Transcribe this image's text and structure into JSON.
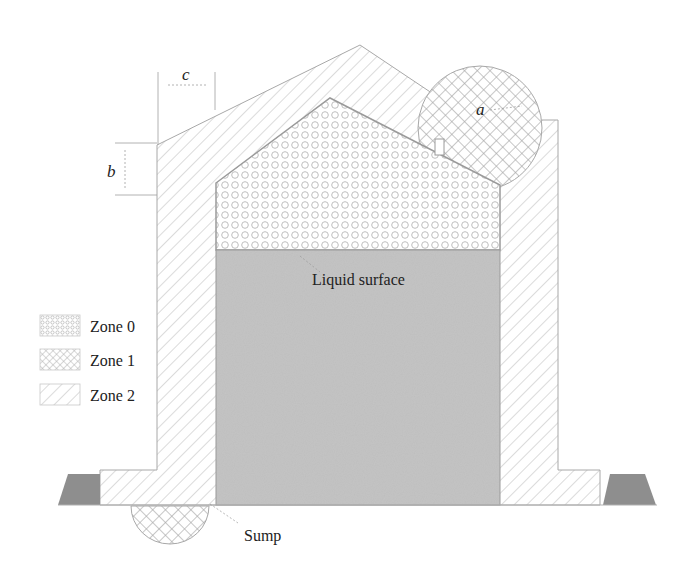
{
  "diagram": {
    "type": "hazardous-area-classification",
    "labels": {
      "liquid_surface": "Liquid surface",
      "sump": "Sump",
      "dim_a": "a",
      "dim_b": "b",
      "dim_c": "c"
    },
    "legend": [
      {
        "id": "zone0",
        "label": "Zone 0",
        "pattern": "small-circles"
      },
      {
        "id": "zone1",
        "label": "Zone 1",
        "pattern": "cross-hatch"
      },
      {
        "id": "zone2",
        "label": "Zone 2",
        "pattern": "diagonal-hatch"
      }
    ],
    "colors": {
      "liquid": "#c4c4c4",
      "outline": "#9a9a9a",
      "hatch": "#b5b5b5",
      "bund": "#8e8e8e",
      "text": "#222222"
    }
  }
}
